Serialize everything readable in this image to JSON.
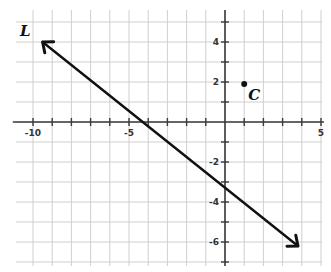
{
  "figure": {
    "type": "coordinate-plane",
    "x_range": [
      -11,
      5
    ],
    "y_range": [
      -7,
      5
    ],
    "grid": true,
    "x_tick_labels": [
      {
        "value": -10,
        "label": "-10"
      },
      {
        "value": -5,
        "label": "-5"
      },
      {
        "value": 5,
        "label": "5"
      }
    ],
    "y_tick_labels": [
      {
        "value": 4,
        "label": "4"
      },
      {
        "value": 2,
        "label": "2"
      },
      {
        "value": -2,
        "label": "-2"
      },
      {
        "value": -4,
        "label": "-4"
      },
      {
        "value": -6,
        "label": "-6"
      }
    ],
    "line": {
      "label": "L",
      "start": [
        -9.5,
        4
      ],
      "end": [
        3.8,
        -6.2
      ],
      "arrows": "both",
      "color": "#111111"
    },
    "point": {
      "label": "C",
      "coords": [
        1,
        1.9
      ],
      "color": "#111111"
    }
  }
}
